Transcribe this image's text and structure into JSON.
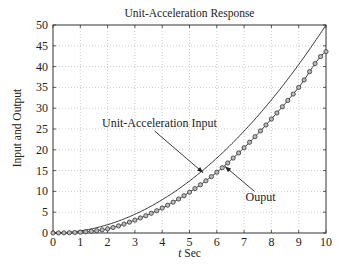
{
  "chart_data": {
    "type": "line",
    "title": "Unit-Acceleration Response",
    "xlabel_var": "t",
    "xlabel_unit": "Sec",
    "xlabel": "t Sec",
    "ylabel": "Input and Output",
    "xlim": [
      0,
      10
    ],
    "ylim": [
      0,
      50
    ],
    "xticks": [
      0,
      1,
      2,
      3,
      4,
      5,
      6,
      7,
      8,
      9,
      10
    ],
    "yticks": [
      0,
      5,
      10,
      15,
      20,
      25,
      30,
      35,
      40,
      45,
      50
    ],
    "grid": true,
    "series": [
      {
        "name": "Unit-Acceleration Input",
        "style": "solid line",
        "formula": "0.5*t^2",
        "x": [
          0,
          1,
          2,
          3,
          4,
          5,
          6,
          7,
          8,
          9,
          10
        ],
        "values": [
          0,
          0.5,
          2,
          4.5,
          8,
          12.5,
          18,
          24.5,
          32,
          40.5,
          50
        ]
      },
      {
        "name": "Ouput",
        "style": "line with circle markers",
        "x": [
          0,
          1,
          2,
          3,
          4,
          5,
          6,
          7,
          8,
          9,
          10
        ],
        "values": [
          0,
          0.2,
          1.0,
          3.1,
          6.0,
          9.8,
          14.6,
          20.5,
          27.4,
          35.0,
          43.6
        ]
      }
    ],
    "annotations": [
      {
        "text": "Unit-Acceleration Input",
        "x": 3.9,
        "y": 25.5,
        "arrow_to": [
          5.5,
          14.5
        ]
      },
      {
        "text": "Ouput",
        "x": 7.6,
        "y": 7.6,
        "arrow_to": [
          6.3,
          16.0
        ]
      }
    ]
  }
}
